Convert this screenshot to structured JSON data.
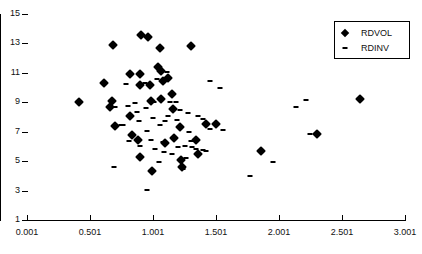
{
  "chart_data": {
    "type": "scatter",
    "title": "",
    "xlabel": "",
    "ylabel": "",
    "xlim": [
      0.001,
      3.001
    ],
    "ylim": [
      1,
      15
    ],
    "xticks": [
      "0.001",
      "0.501",
      "1.001",
      "1.501",
      "2.001",
      "2.501",
      "3.001"
    ],
    "xtick_values": [
      0.001,
      0.501,
      1.001,
      1.501,
      2.001,
      2.501,
      3.001
    ],
    "yticks": [
      "1",
      "3",
      "5",
      "7",
      "9",
      "11",
      "13",
      "15"
    ],
    "ytick_values": [
      1,
      3,
      5,
      7,
      9,
      11,
      13,
      15
    ],
    "grid": false,
    "legend_position": "top-right",
    "series": [
      {
        "name": "RDVOL",
        "marker": "diamond",
        "color": "#000000",
        "points": [
          [
            0.412,
            9.05
          ],
          [
            0.61,
            10.32
          ],
          [
            0.68,
            12.92
          ],
          [
            0.672,
            9.1
          ],
          [
            0.66,
            8.65
          ],
          [
            0.7,
            7.4
          ],
          [
            0.818,
            10.9
          ],
          [
            0.815,
            8.1
          ],
          [
            0.83,
            6.8
          ],
          [
            0.905,
            13.55
          ],
          [
            0.9,
            10.9
          ],
          [
            0.895,
            10.15
          ],
          [
            0.885,
            6.45
          ],
          [
            0.9,
            5.3
          ],
          [
            0.962,
            13.45
          ],
          [
            0.975,
            10.2
          ],
          [
            0.985,
            9.1
          ],
          [
            0.99,
            4.35
          ],
          [
            1.04,
            11.4
          ],
          [
            1.055,
            12.7
          ],
          [
            1.065,
            11.1
          ],
          [
            1.062,
            9.25
          ],
          [
            1.08,
            10.45
          ],
          [
            1.095,
            6.25
          ],
          [
            1.12,
            10.65
          ],
          [
            1.15,
            9.6
          ],
          [
            1.16,
            8.55
          ],
          [
            1.165,
            6.55
          ],
          [
            1.215,
            7.3
          ],
          [
            1.222,
            5.05
          ],
          [
            1.23,
            4.6
          ],
          [
            1.3,
            12.8
          ],
          [
            1.34,
            6.45
          ],
          [
            1.36,
            5.5
          ],
          [
            1.42,
            7.55
          ],
          [
            1.5,
            7.55
          ],
          [
            1.86,
            5.7
          ],
          [
            2.3,
            6.85
          ],
          [
            2.64,
            9.2
          ]
        ]
      },
      {
        "name": "RDINV",
        "marker": "dash",
        "color": "#000000",
        "points": [
          [
            0.688,
            4.6
          ],
          [
            0.7,
            8.7
          ],
          [
            0.745,
            7.45
          ],
          [
            0.76,
            7.45
          ],
          [
            0.79,
            10.25
          ],
          [
            0.8,
            8.75
          ],
          [
            0.81,
            6.35
          ],
          [
            0.855,
            8.95
          ],
          [
            0.87,
            8.35
          ],
          [
            0.89,
            7.7
          ],
          [
            0.9,
            6.05
          ],
          [
            0.935,
            10.3
          ],
          [
            0.945,
            8.6
          ],
          [
            0.95,
            7.05
          ],
          [
            0.955,
            3.05
          ],
          [
            0.985,
            6.45
          ],
          [
            1.0,
            7.95
          ],
          [
            1.01,
            9.0
          ],
          [
            1.02,
            5.85
          ],
          [
            1.03,
            10.6
          ],
          [
            1.045,
            4.95
          ],
          [
            1.055,
            7.45
          ],
          [
            1.08,
            6.3
          ],
          [
            1.09,
            5.6
          ],
          [
            1.095,
            7.75
          ],
          [
            1.11,
            11.05
          ],
          [
            1.12,
            8.05
          ],
          [
            1.135,
            9.05
          ],
          [
            1.15,
            5.5
          ],
          [
            1.175,
            6.6
          ],
          [
            1.185,
            9.05
          ],
          [
            1.195,
            7.8
          ],
          [
            1.2,
            5.95
          ],
          [
            1.215,
            8.45
          ],
          [
            1.24,
            4.45
          ],
          [
            1.255,
            6.0
          ],
          [
            1.265,
            5.2
          ],
          [
            1.28,
            8.3
          ],
          [
            1.29,
            6.95
          ],
          [
            1.3,
            6.4
          ],
          [
            1.31,
            5.95
          ],
          [
            1.345,
            5.8
          ],
          [
            1.36,
            8.1
          ],
          [
            1.395,
            7.9
          ],
          [
            1.4,
            5.75
          ],
          [
            1.42,
            5.7
          ],
          [
            1.45,
            10.45
          ],
          [
            1.455,
            7.2
          ],
          [
            1.53,
            10.0
          ],
          [
            1.555,
            7.15
          ],
          [
            1.77,
            4.0
          ],
          [
            1.95,
            4.95
          ],
          [
            2.135,
            8.65
          ],
          [
            2.215,
            9.15
          ],
          [
            2.245,
            6.85
          ]
        ]
      }
    ]
  },
  "legend": {
    "entries": [
      {
        "label": "RDVOL",
        "marker": "diamond"
      },
      {
        "label": "RDINV",
        "marker": "dash"
      }
    ]
  }
}
